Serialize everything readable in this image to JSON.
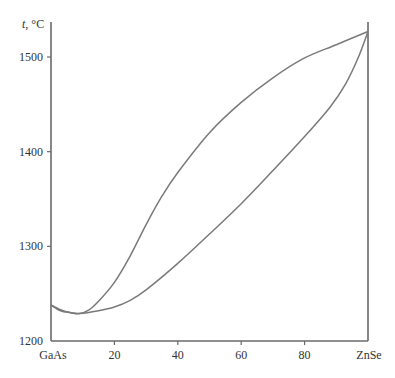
{
  "chart_data": {
    "type": "line",
    "title": "",
    "ylabel_var": "t",
    "ylabel_unit": ", °C",
    "xlabel": "",
    "x_end_labels": {
      "left": "GaAs",
      "right": "ZnSe"
    },
    "xlim": [
      0,
      100
    ],
    "ylim": [
      1200,
      1530
    ],
    "xticks": [
      {
        "value": 20,
        "label": "20"
      },
      {
        "value": 40,
        "label": "40"
      },
      {
        "value": 60,
        "label": "60"
      },
      {
        "value": 80,
        "label": "80"
      }
    ],
    "yticks": [
      {
        "value": 1200,
        "label": "1200"
      },
      {
        "value": 1300,
        "label": "1300"
      },
      {
        "value": 1400,
        "label": "1400"
      },
      {
        "value": 1500,
        "label": "1500"
      }
    ],
    "grid": false,
    "series": [
      {
        "name": "liquidus",
        "x": [
          0,
          3,
          6,
          9,
          12,
          15,
          20,
          25,
          30,
          35,
          40,
          50,
          60,
          70,
          80,
          90,
          100
        ],
        "y": [
          1238,
          1233,
          1230,
          1229,
          1233,
          1242,
          1262,
          1290,
          1323,
          1353,
          1378,
          1420,
          1452,
          1478,
          1499,
          1513,
          1527
        ]
      },
      {
        "name": "solidus",
        "x": [
          0,
          3,
          6,
          9,
          15,
          20,
          25,
          30,
          40,
          50,
          60,
          70,
          80,
          88,
          93,
          97,
          100
        ],
        "y": [
          1238,
          1232,
          1230,
          1229,
          1232,
          1236,
          1243,
          1254,
          1282,
          1313,
          1345,
          1380,
          1416,
          1447,
          1472,
          1500,
          1527
        ]
      }
    ]
  }
}
